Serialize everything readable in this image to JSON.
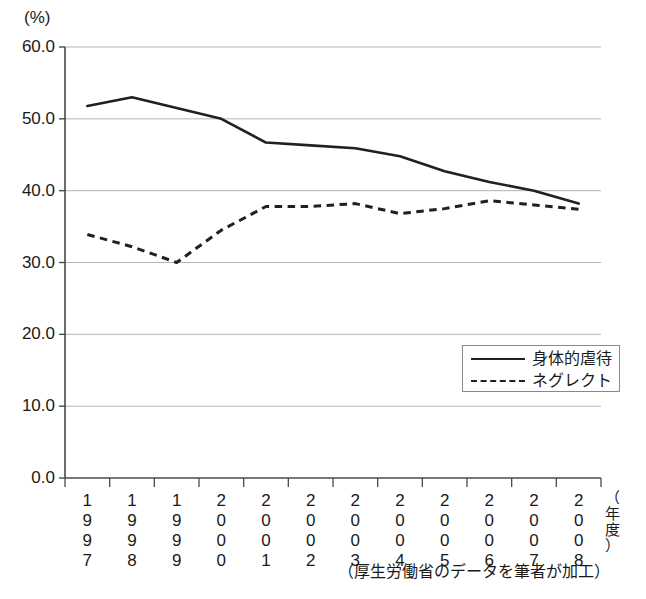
{
  "chart_data": {
    "type": "line",
    "title": "",
    "subtitle": "",
    "xlabel": "（年度）",
    "ylabel": "(%)",
    "ylim": [
      0.0,
      60.0
    ],
    "ytick_labels": [
      "60.0",
      "50.0",
      "40.0",
      "30.0",
      "20.0",
      "10.0",
      "0.0"
    ],
    "ytick_values": [
      60.0,
      50.0,
      40.0,
      30.0,
      20.0,
      10.0,
      0.0
    ],
    "grid": "horizontal",
    "legend_position": "inside-lower-right",
    "categories": [
      "1997",
      "1998",
      "1999",
      "2000",
      "2001",
      "2002",
      "2003",
      "2004",
      "2005",
      "2006",
      "2007",
      "2008"
    ],
    "series": [
      {
        "name": "身体的虐待",
        "style": "solid",
        "color": "#202020",
        "values": [
          51.8,
          53.0,
          51.5,
          50.0,
          46.7,
          46.3,
          45.9,
          44.8,
          42.7,
          41.2,
          40.0,
          38.2
        ]
      },
      {
        "name": "ネグレクト",
        "style": "dashed",
        "color": "#202020",
        "values": [
          33.9,
          32.2,
          30.0,
          34.5,
          37.8,
          37.8,
          38.2,
          36.8,
          37.5,
          38.6,
          38.0,
          37.4
        ]
      }
    ],
    "annotations": [
      "（厚生労働省のデータを筆者が加工）"
    ]
  },
  "axes": {
    "y_unit_label": "(%)",
    "x_unit_label": "（年度）"
  },
  "legend": {
    "entries": [
      {
        "label": "身体的虐待",
        "style": "solid"
      },
      {
        "label": "ネグレクト",
        "style": "dashed"
      }
    ]
  },
  "caption": {
    "source_note": "（厚生労働省のデータを筆者が加工）"
  },
  "colors": {
    "line": "#202020",
    "grid": "#b5b5b5",
    "axis": "#555555",
    "legend_border": "#8a8a8a",
    "background": "#ffffff"
  }
}
